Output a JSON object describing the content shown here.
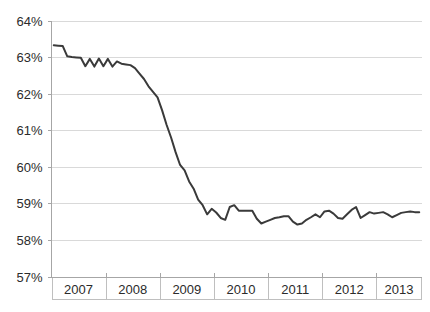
{
  "chart_data": {
    "type": "line",
    "title": "",
    "subtitle": "",
    "xlabel": "",
    "ylabel": "",
    "grid": true,
    "legend": "none",
    "accent_color": "#3a3a3a",
    "grid_color": "#d9d9d9",
    "axis_color": "#a6a6a6",
    "ylim": [
      57,
      64
    ],
    "ytick_labels": [
      "64%",
      "63%",
      "62%",
      "61%",
      "60%",
      "59%",
      "58%",
      "57%"
    ],
    "ytick_values": [
      64,
      63,
      62,
      61,
      60,
      59,
      58,
      57
    ],
    "xtick_labels": [
      "2007",
      "2008",
      "2009",
      "2010",
      "2011",
      "2012",
      "2013"
    ],
    "x_start": "2007-01",
    "x_end": "2013-10",
    "series": [
      {
        "name": "rate",
        "x": [
          "2007-01",
          "2007-02",
          "2007-03",
          "2007-04",
          "2007-05",
          "2007-06",
          "2007-07",
          "2007-08",
          "2007-09",
          "2007-10",
          "2007-11",
          "2007-12",
          "2008-01",
          "2008-02",
          "2008-03",
          "2008-04",
          "2008-05",
          "2008-06",
          "2008-07",
          "2008-08",
          "2008-09",
          "2008-10",
          "2008-11",
          "2008-12",
          "2009-01",
          "2009-02",
          "2009-03",
          "2009-04",
          "2009-05",
          "2009-06",
          "2009-07",
          "2009-08",
          "2009-09",
          "2009-10",
          "2009-11",
          "2009-12",
          "2010-01",
          "2010-02",
          "2010-03",
          "2010-04",
          "2010-05",
          "2010-06",
          "2010-07",
          "2010-08",
          "2010-09",
          "2010-10",
          "2010-11",
          "2010-12",
          "2011-01",
          "2011-02",
          "2011-03",
          "2011-04",
          "2011-05",
          "2011-06",
          "2011-07",
          "2011-08",
          "2011-09",
          "2011-10",
          "2011-11",
          "2011-12",
          "2012-01",
          "2012-02",
          "2012-03",
          "2012-04",
          "2012-05",
          "2012-06",
          "2012-07",
          "2012-08",
          "2012-09",
          "2012-10",
          "2012-11",
          "2012-12",
          "2013-01",
          "2013-02",
          "2013-03",
          "2013-04",
          "2013-05",
          "2013-06",
          "2013-07",
          "2013-08",
          "2013-09",
          "2013-10"
        ],
        "values": [
          63.32,
          63.31,
          63.3,
          63.02,
          63.0,
          62.99,
          62.98,
          62.75,
          62.95,
          62.74,
          62.96,
          62.75,
          62.95,
          62.74,
          62.88,
          62.82,
          62.8,
          62.78,
          62.7,
          62.55,
          62.4,
          62.2,
          62.05,
          61.9,
          61.55,
          61.15,
          60.8,
          60.4,
          60.05,
          59.9,
          59.6,
          59.4,
          59.1,
          58.95,
          58.7,
          58.85,
          58.75,
          58.6,
          58.55,
          58.9,
          58.95,
          58.8,
          58.8,
          58.8,
          58.8,
          58.58,
          58.45,
          58.5,
          58.55,
          58.6,
          58.62,
          58.65,
          58.65,
          58.5,
          58.42,
          58.45,
          58.55,
          58.62,
          58.7,
          58.62,
          58.78,
          58.8,
          58.72,
          58.6,
          58.58,
          58.7,
          58.82,
          58.9,
          58.6,
          58.68,
          58.76,
          58.72,
          58.74,
          58.76,
          58.7,
          58.62,
          58.68,
          58.74,
          58.76,
          58.78,
          58.76,
          58.76
        ]
      }
    ]
  }
}
